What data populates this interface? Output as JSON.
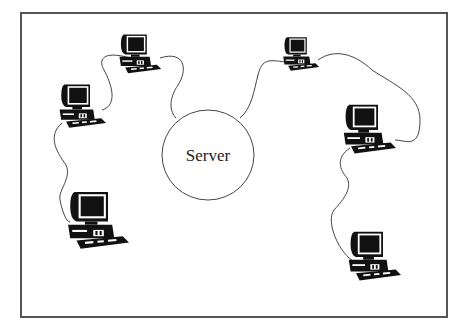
{
  "diagram": {
    "type": "network-topology",
    "frame": {
      "x": 21,
      "y": 13,
      "width": 426,
      "height": 304,
      "stroke": "#555555"
    },
    "server": {
      "label": "Server",
      "cx": 208,
      "cy": 155,
      "rx": 46,
      "ry": 45
    },
    "computers": [
      {
        "id": "pc-top-left",
        "x": 118,
        "y": 33,
        "scale": 0.7
      },
      {
        "id": "pc-left",
        "x": 58,
        "y": 83,
        "scale": 0.75
      },
      {
        "id": "pc-bottom-left",
        "x": 66,
        "y": 190,
        "scale": 0.95
      },
      {
        "id": "pc-top-right",
        "x": 282,
        "y": 36,
        "scale": 0.62
      },
      {
        "id": "pc-right",
        "x": 342,
        "y": 103,
        "scale": 0.85
      },
      {
        "id": "pc-bottom-right",
        "x": 347,
        "y": 230,
        "scale": 0.85
      }
    ],
    "cables": [
      {
        "from": "pc-left",
        "to": "pc-top-left"
      },
      {
        "from": "pc-top-left",
        "to": "server"
      },
      {
        "from": "pc-left",
        "to": "pc-bottom-left"
      },
      {
        "from": "server",
        "to": "pc-top-right"
      },
      {
        "from": "pc-top-right",
        "to": "pc-right"
      },
      {
        "from": "pc-right",
        "to": "pc-bottom-right"
      }
    ]
  }
}
